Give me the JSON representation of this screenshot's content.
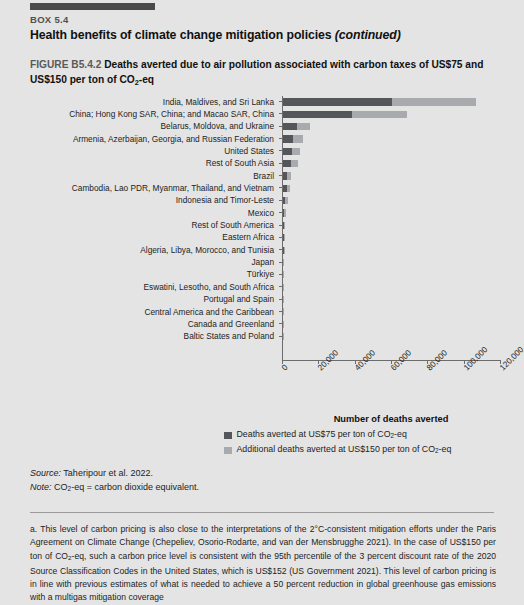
{
  "box": {
    "label": "BOX 5.4",
    "title_main": "Health benefits of climate change mitigation policies ",
    "title_continued": "(continued)"
  },
  "figure": {
    "number": "FIGURE B5.4.2",
    "title_part1": "  Deaths averted due to air pollution associated with carbon taxes of US$75 and US$150 per ton of CO",
    "title_sub": "2",
    "title_part2": "-eq"
  },
  "legend": {
    "item1": "Deaths averted at US$75 per ton of CO",
    "item1_sub": "2",
    "item1_end": "-eq",
    "item2": "Additional deaths averted at US$150 per ton of CO",
    "item2_sub": "2",
    "item2_end": "-eq"
  },
  "notes": {
    "source_label": "Source:",
    "source_text": " Taheripour et al. 2022.",
    "note_label": "Note:",
    "note_text_a": " CO",
    "note_sub": "2",
    "note_text_b": "-eq = carbon dioxide equivalent."
  },
  "footnote": {
    "text_a": "a. This level of carbon pricing is also close to the interpretations of the 2°C-consistent mitigation efforts under the Paris Agreement on Climate Change (Chepeliev, Osorio-Rodarte, and van der Mensbrugghe 2021). In the case of US$150 per ton of CO",
    "sub": "2",
    "text_b": "-eq, such a carbon price level is consistent with the 95th percentile of the 3 percent discount rate of the 2020 Source Classification Codes in the United States, which is US$152 (US Government 2021). This level of carbon pricing is in line with previous estimates of what is needed to achieve a 50 percent reduction in global greenhouse gas emissions with a multigas mitigation coverage"
  },
  "colors": {
    "series1": "#55565a",
    "series2": "#a9aaae",
    "page_background": "#e4e4e4",
    "rule": "#4a4a4a"
  },
  "chart_data": {
    "type": "bar",
    "orientation": "horizontal",
    "stacked": true,
    "title": "Deaths averted due to air pollution associated with carbon taxes of US$75 and US$150 per ton of CO2-eq",
    "xlabel": "Number of deaths averted",
    "ylabel": "",
    "xlim": [
      0,
      120000
    ],
    "xticks": [
      0,
      20000,
      40000,
      60000,
      80000,
      100000,
      120000
    ],
    "xtick_labels": [
      "0",
      "20,000",
      "40,000",
      "60,000",
      "80,000",
      "100,000",
      "120,000"
    ],
    "grid": false,
    "legend_position": "bottom",
    "categories": [
      "India, Maldives, and Sri Lanka",
      "China; Hong Kong SAR, China; and Macao SAR, China",
      "Belarus, Moldova, and Ukraine",
      "Armenia, Azerbaijan, Georgia, and Russian Federation",
      "United States",
      "Rest of South Asia",
      "Brazil",
      "Cambodia, Lao PDR, Myanmar, Thailand, and Vietnam",
      "Indonesia and Timor-Leste",
      "Mexico",
      "Rest of South America",
      "Eastern Africa",
      "Algeria, Libya, Morocco, and Tunisia",
      "Japan",
      "Türkiye",
      "Eswatini, Lesotho, and South Africa",
      "Portugal and Spain",
      "Central America and the Caribbean",
      "Canada and Greenland",
      "Baltic States and Poland"
    ],
    "series": [
      {
        "name": "Deaths averted at US$75 per ton of CO2-eq",
        "color": "#55565a",
        "values": [
          60500,
          38500,
          8200,
          6000,
          5500,
          5000,
          2500,
          2600,
          1800,
          1200,
          1200,
          900,
          900,
          800,
          700,
          600,
          500,
          450,
          400,
          350
        ]
      },
      {
        "name": "Additional deaths averted at US$150 per ton of CO2-eq",
        "color": "#a9aaae",
        "values": [
          46500,
          30500,
          7200,
          5300,
          4200,
          4000,
          2400,
          1600,
          1400,
          900,
          700,
          700,
          500,
          400,
          400,
          350,
          300,
          250,
          200,
          200
        ]
      }
    ]
  }
}
